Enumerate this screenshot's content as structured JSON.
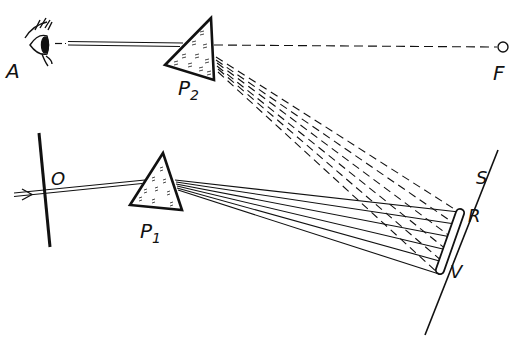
{
  "diagram": {
    "type": "optics-spectrum-recombination",
    "colors": {
      "ink": "#111111",
      "background": "#ffffff"
    },
    "labels": {
      "eye": "A",
      "prism_top": "P",
      "prism_top_sub": "2",
      "focus_point": "F",
      "slit_screen": "O",
      "prism_bottom": "P",
      "prism_bottom_sub": "1",
      "screen": "S",
      "red_end": "R",
      "violet_end": "V"
    }
  }
}
